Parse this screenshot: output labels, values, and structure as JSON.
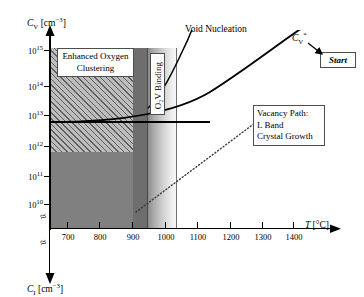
{
  "figure": {
    "y_axis": {
      "symbol": "C",
      "subscript": "V",
      "units": "[cm⁻³]",
      "label": "C_V [cm^-3]",
      "ticks": [
        {
          "mantissa": "10",
          "exp": "15",
          "value": 1000000000000000.0
        },
        {
          "mantissa": "10",
          "exp": "14",
          "value": 100000000000000.0
        },
        {
          "mantissa": "10",
          "exp": "13",
          "value": 10000000000000.0
        },
        {
          "mantissa": "10",
          "exp": "12",
          "value": 1000000000000.0
        },
        {
          "mantissa": "10",
          "exp": "11",
          "value": 100000000000.0
        },
        {
          "mantissa": "10",
          "exp": "10",
          "value": 10000000000.0
        }
      ],
      "break_symbol": "≈"
    },
    "y_axis_secondary": {
      "symbol": "C",
      "subscript": "I",
      "units": "[cm⁻³]",
      "label": "C_I [cm^-3]",
      "break_symbol": "≈",
      "direction": "downward"
    },
    "x_axis": {
      "symbol": "T",
      "units": "[°C]",
      "label": "T [°C]",
      "ticks": [
        "700",
        "800",
        "900",
        "1000",
        "1100",
        "1200",
        "1300",
        "1400"
      ],
      "tick_values": [
        700,
        800,
        900,
        1000,
        1100,
        1200,
        1300,
        1400
      ]
    },
    "regions": [
      {
        "name": "enhanced-oxygen-clustering",
        "label_line1": "Enhanced Oxygen",
        "label_line2": "Clustering",
        "fill": "hatched",
        "color": "#bdbdbd"
      },
      {
        "name": "o2v-binding",
        "label": "O₂V Binding",
        "fill": "gradient",
        "color": "#808080"
      }
    ],
    "curves": [
      {
        "name": "void-nucleation",
        "label": "Void Nucleation",
        "style": "solid"
      },
      {
        "name": "vacancy-path",
        "label_line1": "Vacancy Path:",
        "label_line2": "L Band",
        "label_line3": "Crystal Growth",
        "style": "solid"
      },
      {
        "name": "critical-vacancy-dotted",
        "style": "dotted"
      }
    ],
    "annotations": {
      "cv_star": "C",
      "cv_star_sub": "V",
      "cv_star_sup": "*",
      "cv_star_full": "C_V*",
      "start_button": "Start"
    },
    "colors": {
      "solid_fill": "#808080",
      "hatch_fill": "#bdbdbd",
      "curve": "#000000",
      "axis": "#000000",
      "box_border": "#4d4d4d",
      "background": "#ffffff"
    }
  }
}
